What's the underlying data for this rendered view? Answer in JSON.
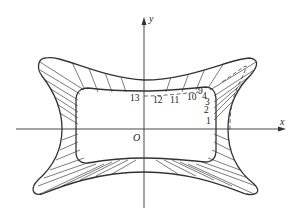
{
  "diagram": {
    "type": "cross-section with hatched band and dashed offset curve",
    "axes": {
      "x_label": "x",
      "y_label": "y",
      "origin_label": "O"
    },
    "point_labels": [
      {
        "id": "p1",
        "text": "1"
      },
      {
        "id": "p2",
        "text": "2"
      },
      {
        "id": "p3",
        "text": "3"
      },
      {
        "id": "p4",
        "text": "4"
      },
      {
        "id": "p9",
        "text": "9"
      },
      {
        "id": "p10",
        "text": "10"
      },
      {
        "id": "p11",
        "text": "11"
      },
      {
        "id": "p12",
        "text": "12"
      },
      {
        "id": "p13",
        "text": "13"
      }
    ],
    "colors": {
      "line": "#333333",
      "background": "#ffffff"
    }
  }
}
